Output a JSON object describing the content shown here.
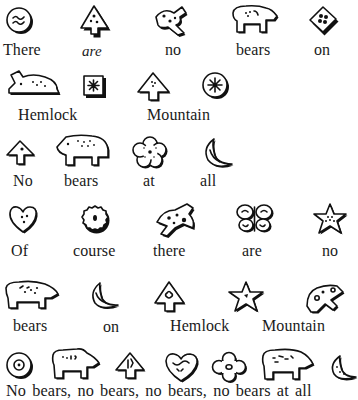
{
  "page": {
    "type": "rebus-poem",
    "lines": [
      {
        "words": [
          "There",
          "are",
          "no",
          "bears",
          "on"
        ],
        "icons": [
          "round-cookie-icon",
          "tree-cookie-icon",
          "bird-cookie-icon",
          "bear-cookie-icon",
          "diamond-cookie-icon"
        ]
      },
      {
        "words": [
          "Hemlock",
          "Mountain"
        ],
        "icons": [
          "rabbit-cookie-icon",
          "square-cookie-icon",
          "tree-cookie-icon",
          "round-cookie-icon"
        ]
      },
      {
        "words": [
          "No",
          "bears",
          "at",
          "all"
        ],
        "icons": [
          "tree-cookie-icon",
          "bear-cookie-icon",
          "flower-cookie-icon",
          "moon-cookie-icon"
        ]
      },
      {
        "words": [
          "Of",
          "course",
          "there",
          "are",
          "no"
        ],
        "icons": [
          "heart-cookie-icon",
          "scalloped-cookie-icon",
          "bird-cookie-icon",
          "butterfly-cookie-icon",
          "star-cookie-icon"
        ]
      },
      {
        "words": [
          "bears",
          "on",
          "Hemlock",
          "Mountain"
        ],
        "icons": [
          "bear-cookie-icon",
          "moon-cookie-icon",
          "tree-cookie-icon",
          "star-cookie-icon",
          "bird-cookie-icon"
        ]
      },
      {
        "words": [
          "No bears, no bears, no bears, no bears at all"
        ],
        "icons": [
          "round-cookie-icon",
          "bear-cookie-icon",
          "tree-cookie-icon",
          "heart-cookie-icon",
          "flower-cookie-icon",
          "bear-cookie-icon",
          "moon-cookie-icon"
        ]
      }
    ],
    "italic_word": "are"
  }
}
